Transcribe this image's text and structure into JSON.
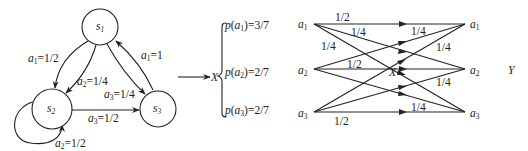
{
  "state_diagram": {
    "states": [
      {
        "id": "s1",
        "name": "s",
        "sub": "1"
      },
      {
        "id": "s2",
        "name": "s",
        "sub": "2"
      },
      {
        "id": "s3",
        "name": "s",
        "sub": "3"
      }
    ],
    "transitions": [
      {
        "from": "s1",
        "to": "s2",
        "symbol": "a",
        "sub": "1",
        "prob": "=1/2"
      },
      {
        "from": "s1",
        "to": "s2",
        "symbol": "a",
        "sub": "2",
        "prob": "=1/4"
      },
      {
        "from": "s1",
        "to": "s3",
        "symbol": "a",
        "sub": "3",
        "prob": "=1/4"
      },
      {
        "from": "s3",
        "to": "s1",
        "symbol": "a",
        "sub": "1",
        "prob": "=1"
      },
      {
        "from": "s2",
        "to": "s3",
        "symbol": "a",
        "sub": "3",
        "prob": "=1/2"
      },
      {
        "from": "s2",
        "to": "s2",
        "symbol": "a",
        "sub": "2",
        "prob": "=1/2"
      }
    ]
  },
  "mapping": {
    "arrow_target": "X",
    "distribution": [
      {
        "func": "p",
        "symbol": "a",
        "sub": "1",
        "value": "=3/7"
      },
      {
        "func": "p",
        "symbol": "a",
        "sub": "2",
        "value": "=2/7"
      },
      {
        "func": "p",
        "symbol": "a",
        "sub": "3",
        "value": "=2/7"
      }
    ]
  },
  "channel": {
    "input_label": "X",
    "output_label": "Y",
    "inputs": [
      {
        "symbol": "a",
        "sub": "1"
      },
      {
        "symbol": "a",
        "sub": "2"
      },
      {
        "symbol": "a",
        "sub": "3"
      }
    ],
    "outputs": [
      {
        "symbol": "a",
        "sub": "1"
      },
      {
        "symbol": "a",
        "sub": "2"
      },
      {
        "symbol": "a",
        "sub": "3"
      }
    ],
    "edge_labels": {
      "a1_a1": "1/2",
      "a1_a2": "1/4",
      "a1_a3": "1/4",
      "a2_a2": "1/2",
      "a3_a3": "1/2",
      "right_top": "1/4",
      "right_mid_upper": "1/4",
      "right_mid_lower": "1/4",
      "right_bottom": "1/4"
    }
  }
}
